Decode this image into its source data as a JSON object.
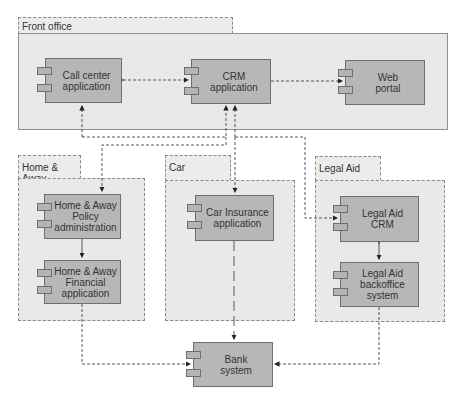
{
  "groups": {
    "front_office": {
      "label": "Front office"
    },
    "home_away": {
      "label": "Home & Away"
    },
    "car": {
      "label": "Car"
    },
    "legal_aid": {
      "label": "Legal Aid"
    }
  },
  "components": {
    "call_center": {
      "label": "Call center\napplication"
    },
    "crm": {
      "label": "CRM application"
    },
    "web_portal": {
      "label": "Web\nportal"
    },
    "ha_policy": {
      "label": "Home & Away\nPolicy\nadministration"
    },
    "ha_financial": {
      "label": "Home & Away\nFinancial\napplication"
    },
    "car_insurance": {
      "label": "Car Insurance\napplication"
    },
    "la_crm": {
      "label": "Legal Aid\nCRM"
    },
    "la_backoffice": {
      "label": "Legal Aid\nbackoffice\nsystem"
    },
    "bank": {
      "label": "Bank\nsystem"
    }
  },
  "colors": {
    "component_fill": "#b7b7b7",
    "group_fill": "#e9e9e9",
    "line": "#444444"
  }
}
